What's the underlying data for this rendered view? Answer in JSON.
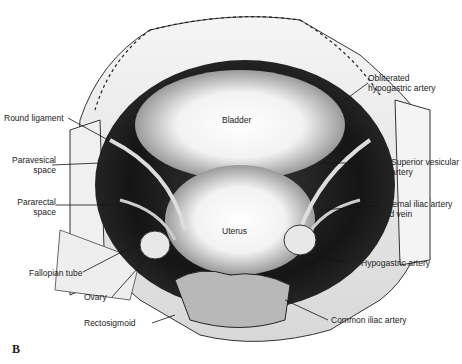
{
  "figure": {
    "panel_letter": "B",
    "organs": {
      "bladder": "Bladder",
      "uterus": "Uterus"
    },
    "labels_left": {
      "round_ligament": "Round ligament",
      "paravesical_1": "Paravesical",
      "paravesical_2": "space",
      "pararectal_1": "Pararectal",
      "pararectal_2": "space",
      "fallopian_tube": "Fallopian tube",
      "ovary": "Ovary",
      "rectosigmoid": "Rectosigmoid"
    },
    "labels_right": {
      "obliterated_1": "Obliterated",
      "obliterated_2": "hypogastric artery",
      "superior_vesicular_1": "Superior vesicular",
      "superior_vesicular_2": "artery",
      "external_iliac_1": "External iliac artery",
      "external_iliac_2": "and vein",
      "hypogastric": "Hypogastric artery",
      "common_iliac": "Common iliac artery"
    }
  }
}
